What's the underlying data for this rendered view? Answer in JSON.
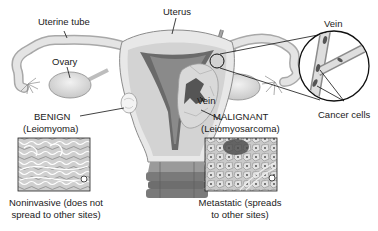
{
  "diagram": {
    "labels": {
      "uterine_tube": "Uterine tube",
      "uterus": "Uterus",
      "ovary": "Ovary",
      "vein_callout": "Vein",
      "vein_uterine": "Vein",
      "cancer_cells": "Cancer cells"
    },
    "benign": {
      "title": "BENIGN",
      "subtitle": "(Leiomyoma)",
      "caption_line1": "Noninvasive (does not",
      "caption_line2": "spread to other sites)"
    },
    "malignant": {
      "title": "MALIGNANT",
      "subtitle": "(Leiomyosarcoma)",
      "caption_line1": "Metastatic (spreads",
      "caption_line2": "to other sites)"
    },
    "colors": {
      "tissue_light": "#e6e6e6",
      "tissue_mid": "#bdbdbd",
      "cavity_dark": "#6a6a6a",
      "outline": "#555555",
      "line": "#222222"
    }
  }
}
